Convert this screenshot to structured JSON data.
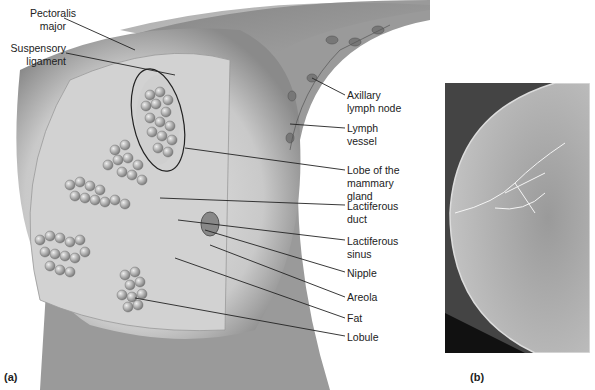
{
  "figure": {
    "panel_a": "(a)",
    "panel_b": "(b)",
    "labels": [
      {
        "id": "pectoralis",
        "text": "Pectoralis\nmajor"
      },
      {
        "id": "suspensory",
        "text": "Suspensory\nligament"
      },
      {
        "id": "axillary",
        "text": "Axillary\nlymph node"
      },
      {
        "id": "lymph_vessel",
        "text": "Lymph\nvessel"
      },
      {
        "id": "lobe",
        "text": "Lobe of the\nmammary\ngland"
      },
      {
        "id": "lact_duct",
        "text": "Lactiferous\nduct"
      },
      {
        "id": "lact_sinus",
        "text": "Lactiferous\nsinus"
      },
      {
        "id": "nipple",
        "text": "Nipple"
      },
      {
        "id": "areola",
        "text": "Areola"
      },
      {
        "id": "fat",
        "text": "Fat"
      },
      {
        "id": "lobule",
        "text": "Lobule"
      }
    ]
  }
}
